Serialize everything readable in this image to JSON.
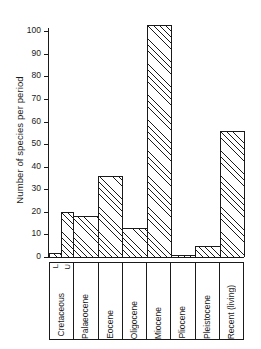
{
  "chart_data": {
    "type": "bar",
    "title": "",
    "subtitle": "",
    "xlabel": "",
    "ylabel": "Number of species per period",
    "ylim": [
      0,
      105
    ],
    "yticks": [
      0,
      10,
      20,
      30,
      40,
      50,
      60,
      70,
      80,
      90,
      100
    ],
    "grid": false,
    "legend": "none",
    "style": "stepped histogram with diagonal hatch fill",
    "categories": [
      "Cretaceous L",
      "Cretaceous U",
      "Palaeocene",
      "Eocene",
      "Oligocene",
      "Miocene",
      "Pliocene",
      "Pleistocene",
      "Recent (living)"
    ],
    "values": [
      2,
      20,
      18,
      36,
      13,
      103,
      1,
      5,
      56
    ],
    "bars": [
      {
        "label": "Cretaceous L",
        "value": 2,
        "width_units": 0.5
      },
      {
        "label": "Cretaceous U",
        "value": 20,
        "width_units": 0.5
      },
      {
        "label": "Palaeocene",
        "value": 18,
        "width_units": 1
      },
      {
        "label": "Eocene",
        "value": 36,
        "width_units": 1
      },
      {
        "label": "Oligocene",
        "value": 13,
        "width_units": 1
      },
      {
        "label": "Miocene",
        "value": 103,
        "width_units": 1
      },
      {
        "label": "Pliocene",
        "value": 1,
        "width_units": 1
      },
      {
        "label": "Pleistocene",
        "value": 5,
        "width_units": 1
      },
      {
        "label": "Recent (living)",
        "value": 56,
        "width_units": 1
      }
    ]
  },
  "axis": {
    "y_title": "Number of species per period",
    "tick_labels": [
      "100",
      "90",
      "80",
      "70",
      "60",
      "50",
      "40",
      "30",
      "20",
      "10",
      "0"
    ]
  },
  "x_categories": [
    {
      "name": "Cretaceous",
      "sub": [
        "L",
        "U"
      ]
    },
    {
      "name": "Palaeocene",
      "sub": []
    },
    {
      "name": "Eocene",
      "sub": []
    },
    {
      "name": "Oligocene",
      "sub": []
    },
    {
      "name": "Miocene",
      "sub": []
    },
    {
      "name": "Pliocene",
      "sub": []
    },
    {
      "name": "Pleistocene",
      "sub": []
    },
    {
      "name": "Recent (living)",
      "sub": []
    }
  ],
  "colors": {
    "ink": "#1a1a1a",
    "background": "#ffffff"
  }
}
